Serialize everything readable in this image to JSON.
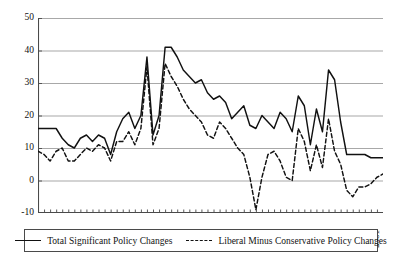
{
  "chart_data": {
    "type": "line",
    "title": "",
    "xlabel": "",
    "ylabel": "",
    "xlim": [
      1945,
      2002
    ],
    "ylim": [
      -10,
      50
    ],
    "ytick_values": [
      50,
      40,
      30,
      20,
      10,
      0,
      -10
    ],
    "ytick_labels": [
      "50",
      "40",
      "30",
      "20",
      "10",
      "0",
      "-10"
    ],
    "xtick_labels": [
      "1945",
      "1949",
      "1953",
      "1957",
      "1961",
      "1965",
      "1969",
      "1973",
      "1977",
      "1981",
      "1985",
      "1989",
      "1993",
      "1997",
      "2001"
    ],
    "xtick_values": [
      1945,
      1949,
      1953,
      1957,
      1961,
      1965,
      1969,
      1973,
      1977,
      1981,
      1985,
      1989,
      1993,
      1997,
      2001
    ],
    "grid": "horizontal",
    "legend_position": "bottom",
    "x": [
      1945,
      1946,
      1947,
      1948,
      1949,
      1950,
      1951,
      1952,
      1953,
      1954,
      1955,
      1956,
      1957,
      1958,
      1959,
      1960,
      1961,
      1962,
      1963,
      1964,
      1965,
      1966,
      1967,
      1968,
      1969,
      1970,
      1971,
      1972,
      1973,
      1974,
      1975,
      1976,
      1977,
      1978,
      1979,
      1980,
      1981,
      1982,
      1983,
      1984,
      1985,
      1986,
      1987,
      1988,
      1989,
      1990,
      1991,
      1992,
      1993,
      1994,
      1995,
      1996,
      1997,
      1998,
      1999,
      2000,
      2001,
      2002
    ],
    "series": [
      {
        "name": "Total Significant Policy Changes",
        "style": "solid",
        "color": "#111111",
        "values": [
          16,
          16,
          16,
          16,
          13,
          11,
          10,
          13,
          14,
          12,
          14,
          13,
          8,
          15,
          19,
          21,
          16,
          20,
          38,
          14,
          20,
          41,
          41,
          38,
          34,
          32,
          30,
          31,
          27,
          25,
          26,
          24,
          19,
          21,
          23,
          17,
          16,
          20,
          18,
          16,
          21,
          19,
          15,
          26,
          23,
          11,
          22,
          15,
          34,
          31,
          18,
          8,
          8,
          8,
          8,
          7,
          7,
          7
        ]
      },
      {
        "name": "Liberal Minus Conservative Policy Changes",
        "style": "dashed",
        "color": "#111111",
        "values": [
          9,
          8,
          6,
          9,
          10,
          6,
          6,
          8,
          10,
          9,
          11,
          10,
          6,
          12,
          12,
          15,
          11,
          16,
          35,
          11,
          16,
          36,
          32,
          29,
          25,
          22,
          20,
          18,
          14,
          13,
          18,
          16,
          13,
          10,
          8,
          1,
          -9,
          1,
          8,
          9,
          6,
          1,
          0,
          16,
          12,
          3,
          11,
          4,
          19,
          9,
          5,
          -3,
          -5,
          -2,
          -2,
          -1,
          1,
          2
        ]
      }
    ]
  },
  "yaxis": {
    "labels": [
      {
        "text": "50",
        "value": 50
      },
      {
        "text": "40",
        "value": 40
      },
      {
        "text": "30",
        "value": 30
      },
      {
        "text": "20",
        "value": 20
      },
      {
        "text": "10",
        "value": 10
      },
      {
        "text": "0",
        "value": 0
      },
      {
        "text": "-10",
        "value": -10
      }
    ]
  },
  "xaxis": {
    "labels": [
      {
        "text": "1945",
        "value": 1945
      },
      {
        "text": "1949",
        "value": 1949
      },
      {
        "text": "1953",
        "value": 1953
      },
      {
        "text": "1957",
        "value": 1957
      },
      {
        "text": "1961",
        "value": 1961
      },
      {
        "text": "1965",
        "value": 1965
      },
      {
        "text": "1969",
        "value": 1969
      },
      {
        "text": "1973",
        "value": 1973
      },
      {
        "text": "1977",
        "value": 1977
      },
      {
        "text": "1981",
        "value": 1981
      },
      {
        "text": "1985",
        "value": 1985
      },
      {
        "text": "1989",
        "value": 1989
      },
      {
        "text": "1993",
        "value": 1993
      },
      {
        "text": "1997",
        "value": 1997
      },
      {
        "text": "2001",
        "value": 2001
      }
    ]
  },
  "legend": {
    "items": [
      {
        "label": "Total Significant Policy Changes",
        "style": "solid"
      },
      {
        "label": "Liberal Minus Conservative Policy Changes",
        "style": "dashed"
      }
    ]
  },
  "colors": {
    "line": "#111111",
    "grid": "#a8a8a8",
    "axis": "#4a4a4a",
    "background": "#ffffff"
  }
}
